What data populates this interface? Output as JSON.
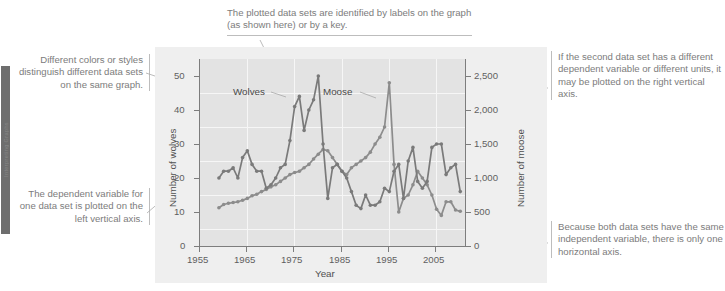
{
  "figure": {
    "annotations": {
      "top": "The plotted data sets are identified by labels on the graph (as shown here) or by a key.",
      "left_upper": "Different colors or styles distinguish different data sets on the same graph.",
      "left_lower": "The dependent variable for one data set is plotted on the left vertical axis.",
      "right_upper": "If the second data set has a different dependent variable or different units, it may be plotted on the right vertical axis.",
      "right_lower": "Because both data sets have the same independent variable, there is only one horizontal axis."
    },
    "edge_tab_label": "Interpreting Graphs"
  },
  "chart_data": {
    "type": "line",
    "title": "",
    "xlabel": "Year",
    "ylabel": "Number of wolves",
    "y2label": "Number of moose",
    "xlim": [
      1955,
      2011
    ],
    "ylim": [
      0,
      55
    ],
    "y2lim": [
      0,
      2750
    ],
    "xticks": [
      1955,
      1965,
      1975,
      1985,
      1995,
      2005
    ],
    "yticks": [
      0,
      10,
      20,
      30,
      40,
      50
    ],
    "y2ticks": [
      "0",
      "500",
      "1,000",
      "1,500",
      "2,000",
      "2,500"
    ],
    "grid": true,
    "legend": "inline-labels",
    "series": [
      {
        "name": "Wolves",
        "axis": "left",
        "color": "#7a7a7a",
        "x": [
          1959,
          1960,
          1961,
          1962,
          1963,
          1964,
          1965,
          1966,
          1967,
          1968,
          1969,
          1970,
          1971,
          1972,
          1973,
          1974,
          1975,
          1976,
          1977,
          1978,
          1979,
          1980,
          1981,
          1982,
          1983,
          1984,
          1985,
          1986,
          1987,
          1988,
          1989,
          1990,
          1991,
          1992,
          1993,
          1994,
          1995,
          1996,
          1997,
          1998,
          1999,
          2000,
          2001,
          2002,
          2003,
          2004,
          2005,
          2006,
          2007,
          2008,
          2009,
          2010
        ],
        "values": [
          20,
          22,
          22,
          23,
          20,
          26,
          28,
          24,
          22,
          22,
          17,
          18,
          20,
          23,
          24,
          31,
          41,
          44,
          34,
          40,
          43,
          50,
          30,
          14,
          23,
          24,
          22,
          20,
          16,
          12,
          11,
          15,
          12,
          12,
          13,
          17,
          16,
          22,
          24,
          14,
          25,
          29,
          19,
          17,
          19,
          29,
          30,
          30,
          21,
          23,
          24,
          16
        ]
      },
      {
        "name": "Moose",
        "axis": "right",
        "color": "#8c8c8c",
        "x": [
          1959,
          1960,
          1961,
          1962,
          1963,
          1964,
          1965,
          1966,
          1967,
          1968,
          1969,
          1970,
          1971,
          1972,
          1973,
          1974,
          1975,
          1976,
          1977,
          1978,
          1979,
          1980,
          1981,
          1982,
          1983,
          1984,
          1985,
          1986,
          1987,
          1988,
          1989,
          1990,
          1991,
          1992,
          1993,
          1994,
          1995,
          1996,
          1997,
          1998,
          1999,
          2000,
          2001,
          2002,
          2003,
          2004,
          2005,
          2006,
          2007,
          2008,
          2009,
          2010
        ],
        "values": [
          563,
          610,
          628,
          640,
          650,
          672,
          700,
          740,
          760,
          800,
          830,
          870,
          900,
          950,
          1000,
          1050,
          1080,
          1100,
          1150,
          1200,
          1280,
          1350,
          1420,
          1400,
          1300,
          1200,
          1100,
          1050,
          1150,
          1200,
          1250,
          1300,
          1380,
          1500,
          1600,
          1750,
          2400,
          1200,
          500,
          700,
          750,
          900,
          1100,
          1000,
          900,
          750,
          540,
          450,
          650,
          650,
          530,
          510
        ]
      }
    ]
  }
}
